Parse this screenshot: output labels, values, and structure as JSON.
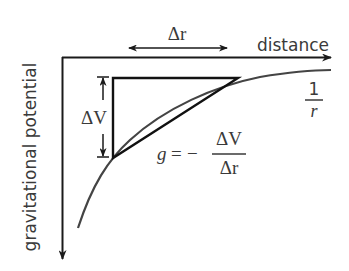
{
  "diagram": {
    "type": "physics-graph",
    "colors": {
      "axis": "#1a1a1a",
      "curve": "#444444",
      "triangle": "#111111",
      "text": "#3a3a3a"
    },
    "axes": {
      "x_label": "distance",
      "y_label": "gravitational potential"
    },
    "curve": {
      "label_numerator": "1",
      "label_denominator": "r"
    },
    "delta_r": {
      "label": "Δr"
    },
    "delta_v": {
      "label": "ΔV"
    },
    "formula": {
      "lhs": "g",
      "equals": "=",
      "minus": "−",
      "numerator": "ΔV",
      "denominator": "Δr"
    }
  }
}
